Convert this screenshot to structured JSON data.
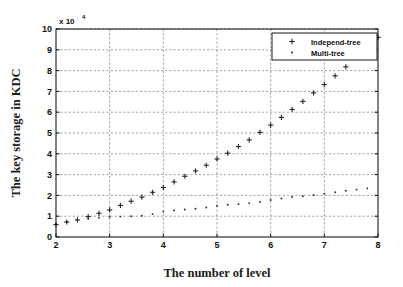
{
  "chart_data": {
    "type": "scatter",
    "title": "",
    "xlabel": "The number of level",
    "ylabel": "The key storage in KDC",
    "y_multiplier": "x 10",
    "y_multiplier_exponent": "4",
    "xlim": [
      2,
      8
    ],
    "ylim": [
      0,
      10
    ],
    "xticks": [
      "2",
      "3",
      "4",
      "5",
      "6",
      "7",
      "8"
    ],
    "yticks": [
      "0",
      "1",
      "2",
      "3",
      "4",
      "5",
      "6",
      "7",
      "8",
      "9",
      "10"
    ],
    "grid": true,
    "grid_style": "dotted",
    "legend_position": "top-right",
    "series": [
      {
        "name": "Independ-tree",
        "marker": "plus",
        "color": "#252525",
        "x": [
          2.0,
          2.2,
          2.4,
          2.6,
          2.8,
          3.0,
          3.2,
          3.4,
          3.6,
          3.8,
          4.0,
          4.2,
          4.4,
          4.6,
          4.8,
          5.0,
          5.2,
          5.4,
          5.6,
          5.8,
          6.0,
          6.2,
          6.4,
          6.6,
          6.8,
          7.0,
          7.2,
          7.4,
          8.0
        ],
        "values": [
          0.6,
          0.72,
          0.82,
          0.98,
          1.14,
          1.3,
          1.52,
          1.72,
          1.92,
          2.15,
          2.38,
          2.65,
          2.92,
          3.18,
          3.45,
          3.75,
          4.03,
          4.35,
          4.67,
          5.03,
          5.38,
          5.75,
          6.13,
          6.52,
          6.93,
          7.33,
          7.75,
          8.18,
          9.6
        ]
      },
      {
        "name": "Multi-tree",
        "marker": "dot",
        "color": "#2b2b2b",
        "x": [
          2.0,
          2.2,
          2.4,
          2.6,
          2.8,
          3.0,
          3.2,
          3.4,
          3.6,
          3.8,
          4.0,
          4.2,
          4.4,
          4.6,
          4.8,
          5.0,
          5.2,
          5.4,
          5.6,
          5.8,
          6.0,
          6.2,
          6.4,
          6.6,
          6.8,
          7.0,
          7.2,
          7.4,
          7.6,
          7.8
        ],
        "values": [
          0.62,
          0.72,
          0.8,
          0.88,
          0.92,
          0.96,
          0.98,
          1.0,
          1.02,
          1.1,
          1.22,
          1.28,
          1.32,
          1.36,
          1.42,
          1.5,
          1.55,
          1.58,
          1.63,
          1.68,
          1.78,
          1.85,
          1.92,
          1.96,
          2.02,
          2.08,
          2.15,
          2.22,
          2.28,
          2.34
        ]
      }
    ]
  },
  "legend": {
    "entries": [
      {
        "label": "Independ-tree",
        "marker": "plus"
      },
      {
        "label": "Multi-tree",
        "marker": "dot"
      }
    ]
  }
}
